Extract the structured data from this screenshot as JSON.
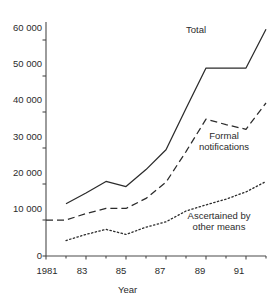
{
  "chart_data": {
    "type": "line",
    "title": "",
    "xlabel": "Year",
    "ylabel": "",
    "xlim": [
      1981,
      1992
    ],
    "ylim": [
      0,
      65000
    ],
    "grid": false,
    "legend_position": "inline-annotations",
    "x": [
      1982,
      1983,
      1984,
      1985,
      1986,
      1987,
      1988,
      1989,
      1990,
      1991,
      1992
    ],
    "x_tick_labels": [
      "1981",
      "83",
      "85",
      "87",
      "89",
      "91"
    ],
    "x_tick_values": [
      1981,
      1983,
      1985,
      1987,
      1989,
      1991
    ],
    "x_minor_tick_values": [
      1982,
      1984,
      1986,
      1988,
      1990,
      1992
    ],
    "y_tick_labels": [
      "0",
      "10 000",
      "20 000",
      "30 000",
      "40 000",
      "50 000",
      "60 000"
    ],
    "y_tick_values": [
      0,
      10000,
      20000,
      30000,
      40000,
      50000,
      60000
    ],
    "series": [
      {
        "name": "Total",
        "style": "solid",
        "label_lines": [
          "Total"
        ],
        "values": [
          14500,
          17500,
          20700,
          19300,
          24000,
          29500,
          41000,
          52200,
          52200,
          52200,
          63000
        ]
      },
      {
        "name": "Formal notifications",
        "style": "dashed",
        "label_lines": [
          "Formal",
          "notifications"
        ],
        "leader_value": 10000,
        "values": [
          10000,
          11800,
          13200,
          13200,
          16000,
          20500,
          29000,
          38000,
          36500,
          35200,
          42500
        ]
      },
      {
        "name": "Ascertained by other means",
        "style": "dotted",
        "label_lines": [
          "Ascertained by",
          "other means"
        ],
        "values": [
          4300,
          6000,
          7400,
          6000,
          8000,
          9500,
          12500,
          14200,
          15800,
          17800,
          20700
        ]
      }
    ]
  },
  "annotations": {
    "total_label": "Total",
    "formal_label_line1": "Formal",
    "formal_label_line2": "notifications",
    "ascertained_label_line1": "Ascertained by",
    "ascertained_label_line2": "other means"
  },
  "colors": {
    "axis": "#4a4a4a",
    "series": "#2b2b2b",
    "background": "#ffffff",
    "text": "#2b2b2b"
  }
}
